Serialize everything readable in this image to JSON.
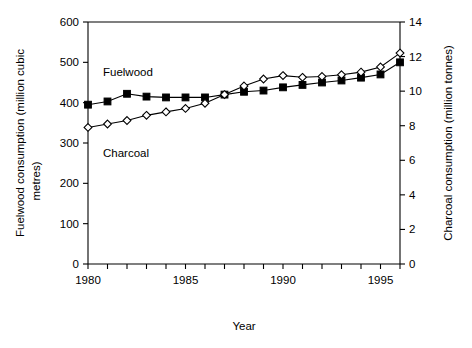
{
  "chart_data": {
    "type": "line",
    "title": "",
    "subtitle": "",
    "xlabel": "Year",
    "ylabel": "Fuelwood consumption (million cubic metres)",
    "y2label": "Charcoal consumption (million tonnes)",
    "grid": false,
    "legend_position": "inline-annotations",
    "x": [
      1980,
      1981,
      1982,
      1983,
      1984,
      1985,
      1986,
      1987,
      1988,
      1989,
      1990,
      1991,
      1992,
      1993,
      1994,
      1995,
      1996
    ],
    "xlim": [
      1980,
      1996
    ],
    "xticks": [
      1980,
      1981,
      1982,
      1983,
      1984,
      1985,
      1986,
      1987,
      1988,
      1989,
      1990,
      1991,
      1992,
      1993,
      1994,
      1995,
      1996
    ],
    "xtick_labels_shown": [
      "1980",
      "1985",
      "1990",
      "1995"
    ],
    "xtick_labels_shown_at": [
      1980,
      1985,
      1990,
      1995
    ],
    "ylim": [
      0,
      600
    ],
    "yticks": [
      0,
      100,
      200,
      300,
      400,
      500,
      600
    ],
    "ytick_labels": [
      "0",
      "100",
      "200",
      "300",
      "400",
      "500",
      "600"
    ],
    "y2lim": [
      0,
      14
    ],
    "y2ticks": [
      0,
      2,
      4,
      6,
      8,
      10,
      12,
      14
    ],
    "y2tick_labels": [
      "0",
      "2",
      "4",
      "6",
      "8",
      "10",
      "12",
      "14"
    ],
    "series": [
      {
        "name": "Fuelwood",
        "axis": "left",
        "marker": "filled-square",
        "units": "million cubic metres",
        "values": [
          395,
          403,
          422,
          415,
          413,
          413,
          413,
          420,
          427,
          430,
          438,
          444,
          450,
          455,
          462,
          470,
          500
        ]
      },
      {
        "name": "Charcoal",
        "axis": "right",
        "marker": "open-diamond",
        "units": "million tonnes",
        "values": [
          7.9,
          8.1,
          8.3,
          8.6,
          8.8,
          9.0,
          9.3,
          9.8,
          10.3,
          10.7,
          10.9,
          10.8,
          10.85,
          10.95,
          11.1,
          11.4,
          12.2
        ]
      }
    ],
    "annotations": [
      {
        "text": "Fuelwood",
        "series": "Fuelwood"
      },
      {
        "text": "Charcoal",
        "series": "Charcoal"
      }
    ],
    "colors": {
      "axis": "#000000",
      "fuelwood": "#000000",
      "charcoal": "#000000",
      "background": "#ffffff"
    }
  }
}
